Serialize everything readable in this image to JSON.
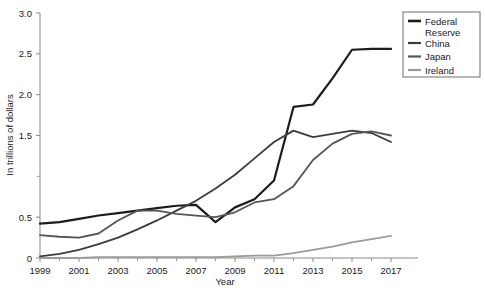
{
  "chart_data": {
    "type": "line",
    "title": "",
    "xlabel": "Year",
    "ylabel": "In trillions of dollars",
    "xlim": [
      1999,
      2017
    ],
    "ylim": [
      0,
      3.0
    ],
    "grid": false,
    "legend_position": "right-outside",
    "x": [
      1999,
      2000,
      2001,
      2002,
      2003,
      2004,
      2005,
      2006,
      2007,
      2008,
      2009,
      2010,
      2011,
      2012,
      2013,
      2014,
      2015,
      2016,
      2017
    ],
    "xticks": [
      "1999",
      "2001",
      "2003",
      "2005",
      "2007",
      "2009",
      "2011",
      "2013",
      "2015",
      "2017"
    ],
    "xtick_values": [
      1999,
      2001,
      2003,
      2005,
      2007,
      2009,
      2011,
      2013,
      2015,
      2017
    ],
    "xminor_values": [
      2000,
      2002,
      2004,
      2006,
      2008,
      2010,
      2012,
      2014,
      2016
    ],
    "yticks": [
      "0",
      "0.5",
      "1.5",
      "2.0",
      "2.5",
      "3.0"
    ],
    "ytick_values": [
      0,
      0.5,
      1.5,
      2.0,
      2.5,
      3.0
    ],
    "yminor_values": [
      1.0
    ],
    "series": [
      {
        "name": "Federal Reserve",
        "color": "#1c1c1c",
        "width": 2.2,
        "values": [
          0.42,
          0.44,
          0.48,
          0.52,
          0.55,
          0.58,
          0.61,
          0.64,
          0.65,
          0.44,
          0.62,
          0.72,
          0.95,
          1.85,
          1.88,
          2.2,
          2.55,
          2.56,
          2.56
        ]
      },
      {
        "name": "China",
        "color": "#3c3c3c",
        "width": 1.8,
        "values": [
          0.02,
          0.05,
          0.1,
          0.17,
          0.25,
          0.35,
          0.46,
          0.58,
          0.7,
          0.85,
          1.02,
          1.22,
          1.42,
          1.56,
          1.48,
          1.52,
          1.56,
          1.53,
          1.42
        ]
      },
      {
        "name": "Japan",
        "color": "#565656",
        "width": 1.8,
        "values": [
          0.28,
          0.26,
          0.25,
          0.3,
          0.46,
          0.58,
          0.58,
          0.54,
          0.52,
          0.5,
          0.56,
          0.68,
          0.72,
          0.88,
          1.2,
          1.4,
          1.52,
          1.55,
          1.5
        ]
      },
      {
        "name": "Ireland",
        "color": "#9b9b9b",
        "width": 1.8,
        "values": [
          0.0,
          0.0,
          0.0,
          0.01,
          0.01,
          0.01,
          0.01,
          0.01,
          0.01,
          0.01,
          0.02,
          0.03,
          0.03,
          0.06,
          0.1,
          0.14,
          0.19,
          0.23,
          0.27
        ]
      }
    ]
  },
  "legend": {
    "items": [
      {
        "label": "Federal Reserve"
      },
      {
        "label": "China"
      },
      {
        "label": "Japan"
      },
      {
        "label": "Ireland"
      }
    ]
  }
}
